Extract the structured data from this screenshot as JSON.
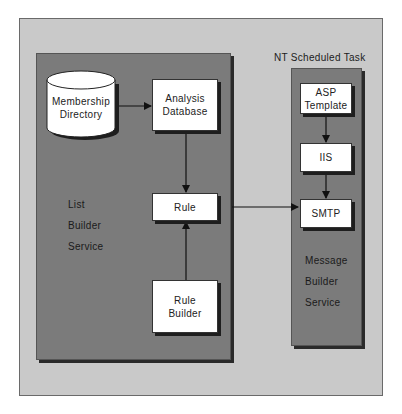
{
  "diagram": {
    "outer_frame": {
      "color": "#c9c9c9"
    },
    "nt_task_label": "NT Scheduled Task",
    "list_builder": {
      "label_lines": [
        "List",
        "Builder",
        "Service"
      ],
      "color": "#7b7b7b",
      "nodes": {
        "membership": {
          "line1": "Membership",
          "line2": "Directory",
          "shape": "cylinder"
        },
        "analysis": {
          "line1": "Analysis",
          "line2": "Database"
        },
        "rule": {
          "label": "Rule"
        },
        "rule_builder": {
          "line1": "Rule",
          "line2": "Builder"
        }
      }
    },
    "message_builder": {
      "label_lines": [
        "Message",
        "Builder",
        "Service"
      ],
      "color": "#7b7b7b",
      "nodes": {
        "asp": {
          "line1": "ASP",
          "line2": "Template"
        },
        "iis": {
          "label": "IIS"
        },
        "smtp": {
          "label": "SMTP"
        }
      }
    },
    "edges": [
      {
        "from": "Membership Directory",
        "to": "Analysis Database"
      },
      {
        "from": "Analysis Database",
        "to": "Rule"
      },
      {
        "from": "Rule Builder",
        "to": "Rule"
      },
      {
        "from": "Rule",
        "to": "SMTP"
      },
      {
        "from": "ASP Template",
        "to": "IIS"
      },
      {
        "from": "IIS",
        "to": "SMTP"
      }
    ]
  }
}
